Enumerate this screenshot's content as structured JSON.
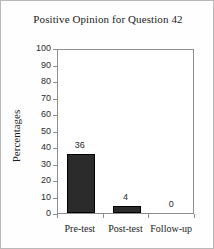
{
  "figure": {
    "background_color": "#fefefe",
    "frame_color": "#b9b9b9"
  },
  "chart_data": {
    "type": "bar",
    "title": "Positive Opinion for Question 42",
    "xlabel": "",
    "ylabel": "Percentages",
    "categories": [
      "Pre-test",
      "Post-test",
      "Follow-up"
    ],
    "values": [
      36,
      4,
      0
    ],
    "data_labels": [
      "36",
      "4",
      "0"
    ],
    "ylim": [
      0,
      100
    ],
    "ytick_step": 10,
    "ytick_labels": [
      "100",
      "90",
      "80",
      "70",
      "60",
      "50",
      "40",
      "30",
      "20",
      "10",
      "0"
    ],
    "grid": false,
    "legend": false,
    "legend_position": "none",
    "bar_color": "#2b2b2b",
    "axis_color": "#8d8d8d"
  }
}
